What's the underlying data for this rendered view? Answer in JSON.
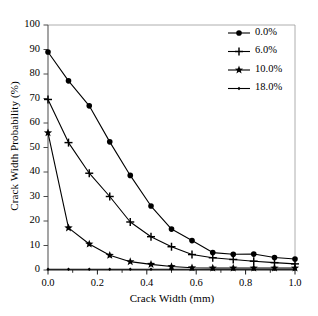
{
  "chart_data": {
    "type": "line",
    "title": "",
    "xlabel": "Crack Width (mm)",
    "ylabel": "Crack Width Probability (%)",
    "xlim": [
      0.0,
      1.0
    ],
    "ylim": [
      0,
      100
    ],
    "xticks": [
      "0.0",
      "0.2",
      "0.4",
      "0.6",
      "0.8",
      "1.0"
    ],
    "xtick_values": [
      0.0,
      0.2,
      0.4,
      0.6,
      0.8,
      1.0
    ],
    "yticks": [
      "0",
      "10",
      "20",
      "30",
      "40",
      "50",
      "60",
      "70",
      "80",
      "90",
      "100"
    ],
    "ytick_values": [
      0,
      10,
      20,
      30,
      40,
      50,
      60,
      70,
      80,
      90,
      100
    ],
    "grid": false,
    "legend_position": "top-right",
    "x": [
      0.0,
      0.083,
      0.167,
      0.25,
      0.333,
      0.417,
      0.5,
      0.583,
      0.667,
      0.75,
      0.833,
      0.917,
      1.0
    ],
    "series": [
      {
        "name": "0.0%",
        "marker": "circle",
        "color": "#000000",
        "values": [
          89.0,
          77.2,
          67.0,
          52.3,
          38.6,
          26.1,
          16.7,
          12.0,
          7.1,
          6.4,
          6.5,
          5.1,
          4.5
        ]
      },
      {
        "name": "6.0%",
        "marker": "plus",
        "color": "#000000",
        "values": [
          69.6,
          52.0,
          39.5,
          30.0,
          19.6,
          13.6,
          9.5,
          6.3,
          5.0,
          4.3,
          3.6,
          3.0,
          2.5
        ]
      },
      {
        "name": "10.0%",
        "marker": "star",
        "color": "#000000",
        "values": [
          56.0,
          17.2,
          10.6,
          6.0,
          3.4,
          2.3,
          1.4,
          0.9,
          0.8,
          0.8,
          0.8,
          0.8,
          0.8
        ]
      },
      {
        "name": "18.0%",
        "marker": "diamond",
        "color": "#000000",
        "values": [
          0.3,
          0.3,
          0.3,
          0.3,
          0.3,
          0.3,
          0.3,
          0.3,
          0.3,
          0.3,
          0.3,
          0.3,
          0.3
        ]
      }
    ]
  },
  "legend": {
    "entries": [
      {
        "label": "0.0%"
      },
      {
        "label": "6.0%"
      },
      {
        "label": "10.0%"
      },
      {
        "label": "18.0%"
      }
    ]
  },
  "axes": {
    "x_label": "Crack Width (mm)",
    "y_label": "Crack Width Probability (%)"
  }
}
